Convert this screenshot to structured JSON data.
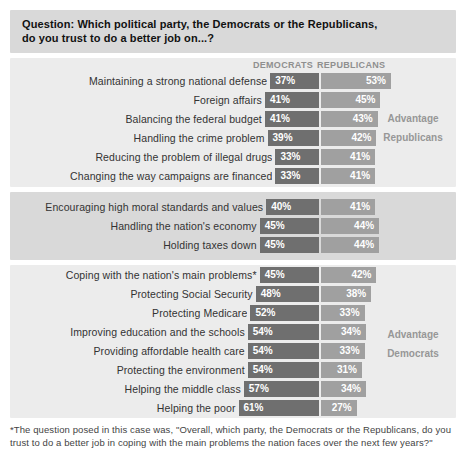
{
  "header": {
    "line1": "Question: Which political party, the Democrats or the Republicans,",
    "line2": "do you trust to do a better job on...?"
  },
  "columns": {
    "democrats": "DEMOCRATS",
    "republicans": "REPUBLICANS"
  },
  "colors": {
    "democrat_bar": "#6f6f6f",
    "republican_bar": "#a0a0a0",
    "band_medium": "#d9d9d9",
    "band_light": "#ececec",
    "bar_value_text": "#ffffff"
  },
  "sections": [
    {
      "background": "light",
      "advantage": {
        "line1": "Advantage",
        "line2": "Republicans"
      },
      "rows": [
        {
          "label": "Maintaining a strong national defense",
          "dem": "37%",
          "rep": "53%"
        },
        {
          "label": "Foreign affairs",
          "dem": "41%",
          "rep": "45%"
        },
        {
          "label": "Balancing the federal budget",
          "dem": "41%",
          "rep": "43%"
        },
        {
          "label": "Handling the crime problem",
          "dem": "39%",
          "rep": "42%"
        },
        {
          "label": "Reducing the problem of illegal drugs",
          "dem": "33%",
          "rep": "41%"
        },
        {
          "label": "Changing the way campaigns are financed",
          "dem": "33%",
          "rep": "41%"
        }
      ]
    },
    {
      "background": "medium",
      "advantage": null,
      "rows": [
        {
          "label": "Encouraging high moral standards and values",
          "dem": "40%",
          "rep": "41%"
        },
        {
          "label": "Handling the nation's economy",
          "dem": "45%",
          "rep": "44%"
        },
        {
          "label": "Holding taxes down",
          "dem": "45%",
          "rep": "44%"
        }
      ]
    },
    {
      "background": "light",
      "advantage": {
        "line1": "Advantage",
        "line2": "Democrats"
      },
      "rows": [
        {
          "label": "Coping with the nation's main problems*",
          "dem": "45%",
          "rep": "42%"
        },
        {
          "label": "Protecting Social Security",
          "dem": "48%",
          "rep": "38%"
        },
        {
          "label": "Protecting Medicare",
          "dem": "52%",
          "rep": "33%"
        },
        {
          "label": "Improving education and the schools",
          "dem": "54%",
          "rep": "34%"
        },
        {
          "label": "Providing affordable health care",
          "dem": "54%",
          "rep": "33%"
        },
        {
          "label": "Protecting the environment",
          "dem": "54%",
          "rep": "31%"
        },
        {
          "label": "Helping the middle class",
          "dem": "57%",
          "rep": "34%"
        },
        {
          "label": "Helping the poor",
          "dem": "61%",
          "rep": "27%"
        }
      ]
    }
  ],
  "footnote": "*The question posed in this case was, \"Overall, which party, the Democrats or the Republicans, do you trust to do a better job in coping with the main problems the nation faces over the next few years?\"",
  "chart_data": {
    "type": "bar",
    "title": "Question: Which political party, the Democrats or the Republicans, do you trust to do a better job on...?",
    "unit": "%",
    "categories": [
      "Maintaining a strong national defense",
      "Foreign affairs",
      "Balancing the federal budget",
      "Handling the crime problem",
      "Reducing the problem of illegal drugs",
      "Changing the way campaigns are financed",
      "Encouraging high moral standards and values",
      "Handling the nation's economy",
      "Holding taxes down",
      "Coping with the nation's main problems*",
      "Protecting Social Security",
      "Protecting Medicare",
      "Improving education and the schools",
      "Providing affordable health care",
      "Protecting the environment",
      "Helping the middle class",
      "Helping the poor"
    ],
    "series": [
      {
        "name": "Democrats",
        "values": [
          37,
          41,
          41,
          39,
          33,
          33,
          40,
          45,
          45,
          45,
          48,
          52,
          54,
          54,
          54,
          57,
          61
        ]
      },
      {
        "name": "Republicans",
        "values": [
          53,
          45,
          43,
          42,
          41,
          41,
          41,
          44,
          44,
          42,
          38,
          33,
          34,
          33,
          31,
          34,
          27
        ]
      }
    ],
    "annotations": [
      {
        "text": "Advantage Republicans",
        "applies_to_category_indexes": [
          0,
          1,
          2,
          3,
          4,
          5
        ]
      },
      {
        "text": "Advantage Democrats",
        "applies_to_category_indexes": [
          9,
          10,
          11,
          12,
          13,
          14,
          15,
          16
        ]
      }
    ],
    "layout": {
      "orientation": "horizontal",
      "bar_anchor": "center-diverging",
      "value_labels": "inside-bars",
      "grid": false,
      "legend_position": "column-headers-top",
      "px_per_percent": 1.32
    }
  }
}
